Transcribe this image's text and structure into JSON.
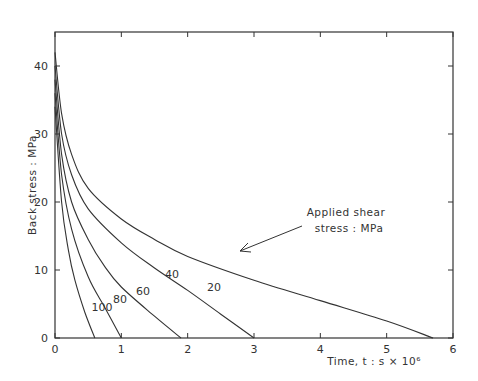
{
  "chart_data": {
    "type": "line",
    "title": "",
    "xlabel": "Time, t  : s × 10⁶",
    "ylabel": "Back stress : MPa",
    "xlim": [
      0,
      6
    ],
    "ylim": [
      0,
      45
    ],
    "xticks": [
      "0",
      "1",
      "2",
      "3",
      "4",
      "5",
      "6"
    ],
    "yticks": [
      "0",
      "10",
      "20",
      "30",
      "40"
    ],
    "grid": false,
    "legend": "none (curves labelled inline)",
    "annotation": {
      "line1": "Applied shear",
      "line2": "stress : MPa"
    },
    "series": [
      {
        "name": "20",
        "label": "20",
        "x": [
          0,
          0.1,
          0.25,
          0.5,
          1.0,
          1.5,
          2.0,
          3.0,
          4.0,
          5.0,
          5.7
        ],
        "y": [
          42,
          33,
          27,
          22,
          17.5,
          14.5,
          12,
          8.5,
          5.5,
          2.5,
          0
        ]
      },
      {
        "name": "40",
        "label": "40",
        "x": [
          0,
          0.1,
          0.25,
          0.5,
          1.0,
          1.5,
          2.0,
          2.5,
          3.0
        ],
        "y": [
          40,
          30,
          24,
          19,
          14,
          10.3,
          7,
          3.5,
          0
        ]
      },
      {
        "name": "60",
        "label": "60",
        "x": [
          0,
          0.1,
          0.25,
          0.5,
          0.75,
          1.0,
          1.5,
          1.9
        ],
        "y": [
          38,
          27,
          20,
          14.5,
          10.5,
          7.5,
          3.2,
          0
        ]
      },
      {
        "name": "80",
        "label": "80",
        "x": [
          0,
          0.1,
          0.25,
          0.5,
          0.75,
          1.0
        ],
        "y": [
          36,
          24,
          16,
          9,
          4.5,
          0
        ]
      },
      {
        "name": "100",
        "label": "100",
        "x": [
          0,
          0.1,
          0.2,
          0.3,
          0.45,
          0.6
        ],
        "y": [
          34,
          20,
          13,
          8.5,
          3.8,
          0
        ]
      }
    ]
  }
}
